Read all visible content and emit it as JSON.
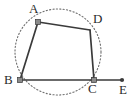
{
  "figure": {
    "kind": "geometry-diagram",
    "background_color": "#ffffff",
    "stroke_color": "#3a3a3a",
    "circle_color": "#6e6e6e",
    "label_color": "#2b2b2b"
  },
  "circle": {
    "name": "circumcircle",
    "style": "dotted",
    "cx": 58,
    "cy": 52,
    "r": 43
  },
  "points": [
    {
      "id": "A",
      "label": "A",
      "x": 38,
      "y": 22,
      "label_x": 29,
      "label_y": 2,
      "marker": "square"
    },
    {
      "id": "B",
      "label": "B",
      "x": 20,
      "y": 80,
      "label_x": 4,
      "label_y": 73,
      "marker": "square"
    },
    {
      "id": "C",
      "label": "C",
      "x": 94,
      "y": 80,
      "label_x": 88,
      "label_y": 82,
      "marker": "square"
    },
    {
      "id": "D",
      "label": "D",
      "x": 90,
      "y": 30,
      "label_x": 93,
      "label_y": 12,
      "marker": "none"
    },
    {
      "id": "E",
      "label": "E",
      "x": 122,
      "y": 80,
      "label_x": 119,
      "label_y": 83,
      "marker": "dot"
    }
  ],
  "segments": [
    {
      "name": "segment-AB",
      "from": "A",
      "to": "B"
    },
    {
      "name": "segment-AD",
      "from": "A",
      "to": "D"
    },
    {
      "name": "segment-DC",
      "from": "D",
      "to": "C"
    },
    {
      "name": "segment-BC",
      "from": "B",
      "to": "C"
    },
    {
      "name": "segment-CE",
      "from": "C",
      "to": "E"
    }
  ]
}
